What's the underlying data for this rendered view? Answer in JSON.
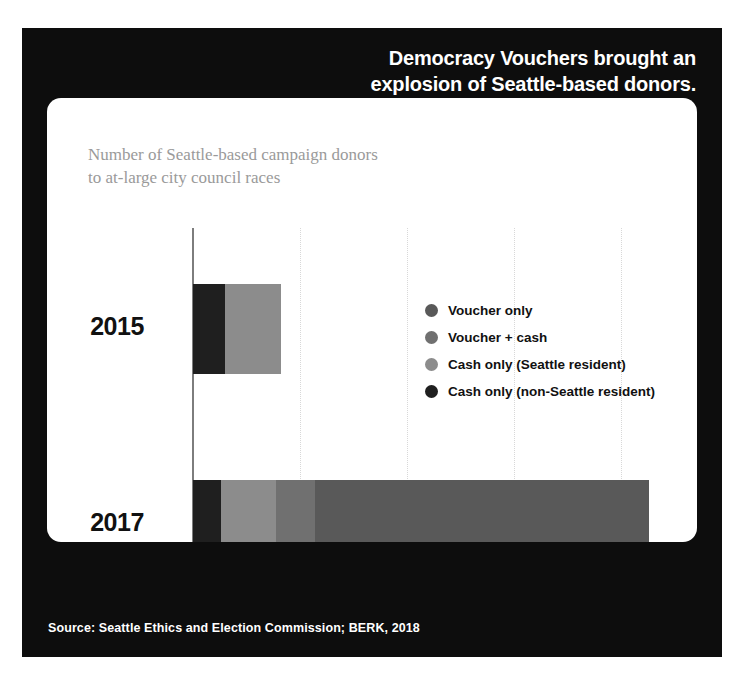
{
  "headline": {
    "line1": "Democracy Vouchers brought an",
    "line2": "explosion of Seattle-based donors."
  },
  "source": {
    "text": "Source: Seattle Ethics and Election Commission; BERK, 2018"
  },
  "legend": {
    "items": [
      {
        "label": "Voucher only",
        "color": "#595959"
      },
      {
        "label": "Voucher + cash",
        "color": "#707070"
      },
      {
        "label": "Cash only (Seattle resident)",
        "color": "#8c8c8c"
      },
      {
        "label": "Cash only (non-Seattle resident)",
        "color": "#1f1f1f"
      }
    ]
  },
  "chart_data": {
    "type": "bar",
    "orientation": "horizontal",
    "stacked": true,
    "title": "Democracy Vouchers brought an explosion of Seattle-based donors.",
    "subtitle_line1": "Number of Seattle-based campaign donors",
    "subtitle_line2": "to at-large city council races",
    "xlabel": "",
    "ylabel": "",
    "categories": [
      "2015",
      "2017"
    ],
    "xlim": [
      0,
      22000
    ],
    "tick_values": [
      5000,
      10000,
      15000,
      20000
    ],
    "tick_labels": [
      "",
      "10k",
      "",
      "20k"
    ],
    "grid": "dotted-vertical",
    "legend_position": "inside-right",
    "series": [
      {
        "name": "Cash only (non-Seattle resident)",
        "color": "#1f1f1f",
        "values": [
          1500,
          1300
        ]
      },
      {
        "name": "Cash only (Seattle resident)",
        "color": "#8c8c8c",
        "values": [
          2600,
          2600
        ]
      },
      {
        "name": "Voucher + cash",
        "color": "#707070",
        "values": [
          0,
          1800
        ]
      },
      {
        "name": "Voucher only",
        "color": "#595959",
        "values": [
          0,
          15600
        ]
      }
    ],
    "totals": [
      4100,
      21300
    ],
    "bars": [
      {
        "category": "2015",
        "segments": [
          {
            "name": "Cash only (non-Seattle resident)",
            "color": "#1f1f1f",
            "value": 1500
          },
          {
            "name": "Cash only (Seattle resident)",
            "color": "#8c8c8c",
            "value": 2600
          }
        ]
      },
      {
        "category": "2017",
        "segments": [
          {
            "name": "Cash only (non-Seattle resident)",
            "color": "#1f1f1f",
            "value": 1300
          },
          {
            "name": "Cash only (Seattle resident)",
            "color": "#8c8c8c",
            "value": 2600
          },
          {
            "name": "Voucher + cash",
            "color": "#707070",
            "value": 1800
          },
          {
            "name": "Voucher only",
            "color": "#595959",
            "value": 15600
          }
        ]
      }
    ]
  },
  "axis": {
    "ticks": [
      {
        "label": "",
        "value": 5000
      },
      {
        "label": "10k",
        "value": 10000
      },
      {
        "label": "",
        "value": 15000
      },
      {
        "label": "20k",
        "value": 20000
      }
    ]
  }
}
